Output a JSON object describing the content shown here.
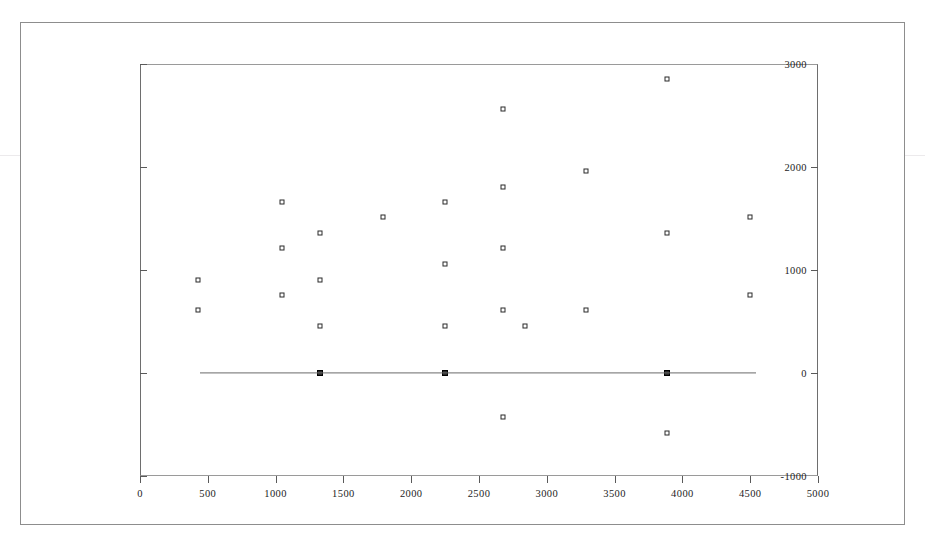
{
  "figure": {
    "background_color": "#ffffff",
    "frame_color": "#8d8d8d",
    "axis_color": "#6e6e6e",
    "marker_color": "#2a2a2a",
    "line_color": "#6b6b6b"
  },
  "chart_data": {
    "type": "scatter",
    "title": "",
    "subtitle": "",
    "xlabel": "",
    "ylabel": "",
    "xlim": [
      0,
      5000
    ],
    "ylim": [
      -1000,
      3000
    ],
    "xticks": [
      0,
      500,
      1000,
      1500,
      2000,
      2500,
      3000,
      3500,
      4000,
      4500,
      5000
    ],
    "xtick_labels": [
      "0",
      "500",
      "1000",
      "1500",
      "2000",
      "2500",
      "3000",
      "3500",
      "4000",
      "4500",
      "5000"
    ],
    "yticks": [
      -1000,
      0,
      1000,
      2000,
      3000
    ],
    "ytick_labels": [
      "-1000",
      "0",
      "1000",
      "2000",
      "3000"
    ],
    "grid": false,
    "legend": null,
    "marker_style": "open-square",
    "series": [
      {
        "name": "observations",
        "marker": "open-square",
        "points": [
          {
            "x": 430,
            "y": 900
          },
          {
            "x": 430,
            "y": 610
          },
          {
            "x": 1050,
            "y": 1660
          },
          {
            "x": 1050,
            "y": 1210
          },
          {
            "x": 1050,
            "y": 760
          },
          {
            "x": 1330,
            "y": 1360
          },
          {
            "x": 1330,
            "y": 900
          },
          {
            "x": 1330,
            "y": 460
          },
          {
            "x": 1790,
            "y": 1510
          },
          {
            "x": 2250,
            "y": 1660
          },
          {
            "x": 2250,
            "y": 1060
          },
          {
            "x": 2250,
            "y": 460
          },
          {
            "x": 2680,
            "y": 2560
          },
          {
            "x": 2680,
            "y": 1810
          },
          {
            "x": 2680,
            "y": 1210
          },
          {
            "x": 2680,
            "y": 610
          },
          {
            "x": 2680,
            "y": -430
          },
          {
            "x": 2840,
            "y": 460
          },
          {
            "x": 3290,
            "y": 1960
          },
          {
            "x": 3290,
            "y": 610
          },
          {
            "x": 3890,
            "y": 2850
          },
          {
            "x": 3890,
            "y": 1360
          },
          {
            "x": 3890,
            "y": -580
          },
          {
            "x": 4500,
            "y": 1510
          },
          {
            "x": 4500,
            "y": 760
          }
        ]
      },
      {
        "name": "fitted-points",
        "marker": "filled-square",
        "points": [
          {
            "x": 1330,
            "y": 0
          },
          {
            "x": 2250,
            "y": 0
          },
          {
            "x": 3890,
            "y": 0
          }
        ]
      }
    ],
    "reference_line": {
      "name": "zero-line",
      "y": 0,
      "x_start": 440,
      "x_end": 4540
    }
  }
}
